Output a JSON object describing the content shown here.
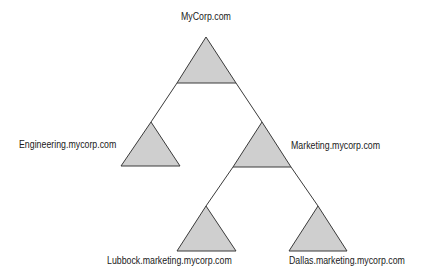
{
  "diagram": {
    "type": "domain-tree",
    "colors": {
      "triangle_fill": "#cfcfcf",
      "stroke": "#3a3a3a",
      "text": "#1a1a1a",
      "background": "#ffffff"
    },
    "nodes": [
      {
        "id": "root",
        "label": "MyCorp.com",
        "apex": [
          206,
          37
        ],
        "base_y": 83,
        "base_x": [
          177,
          236
        ],
        "label_pos": [
          181,
          11
        ]
      },
      {
        "id": "engineering",
        "label": "Engineering.mycorp.com",
        "apex": [
          151,
          122
        ],
        "base_y": 166,
        "base_x": [
          121,
          180
        ],
        "label_pos": [
          19,
          139
        ]
      },
      {
        "id": "marketing",
        "label": "Marketing.mycorp.com",
        "apex": [
          262,
          122
        ],
        "base_y": 167,
        "base_x": [
          233,
          291
        ],
        "label_pos": [
          291,
          140
        ]
      },
      {
        "id": "lubbock",
        "label": "Lubbock.marketing.mycorp.com",
        "apex": [
          206,
          206
        ],
        "base_y": 251,
        "base_x": [
          177,
          236
        ],
        "label_pos": [
          107,
          255
        ]
      },
      {
        "id": "dallas",
        "label": "Dallas.marketing.mycorp.com",
        "apex": [
          318,
          206
        ],
        "base_y": 251,
        "base_x": [
          289,
          347
        ],
        "label_pos": [
          289,
          255
        ]
      }
    ],
    "edges": [
      {
        "from": "root",
        "to": "engineering"
      },
      {
        "from": "root",
        "to": "marketing"
      },
      {
        "from": "marketing",
        "to": "lubbock"
      },
      {
        "from": "marketing",
        "to": "dallas"
      }
    ]
  }
}
